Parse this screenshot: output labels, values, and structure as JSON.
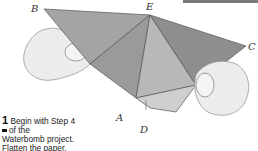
{
  "figure": {
    "labels": {
      "a": "A",
      "b": "B",
      "c": "C",
      "d": "D",
      "e": "E"
    },
    "colors": {
      "paper_dark": "#8f8f8f",
      "paper_mid": "#a8a8a8",
      "paper_light": "#c4c4c4",
      "hand": "#ececec",
      "outline": "#555555"
    }
  },
  "caption": {
    "step_number": "1",
    "line1": "Begin with Step 4",
    "line2": "of the",
    "line3": "Waterbomb project.",
    "line4": "Flatten the paper."
  }
}
